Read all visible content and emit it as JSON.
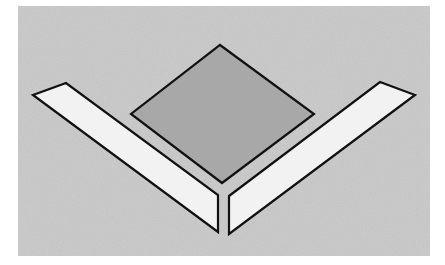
{
  "figure": {
    "background_color": "#ffffff",
    "panel": {
      "x": 18,
      "y": 6,
      "width": 412,
      "height": 250,
      "fill": "#c9c9c9"
    },
    "stroke_color": "#111111",
    "stroke_width": 2.2,
    "shapes": [
      {
        "name": "center-diamond",
        "fill": "#a8a8a8",
        "points": "220,45 314,114 222,183 131,114"
      },
      {
        "name": "left-bar",
        "fill": "#f2f2f2",
        "points": "33,95 66,83 218,195 218,232"
      },
      {
        "name": "right-bar",
        "fill": "#f2f2f2",
        "points": "229,196 380,82 415,95 229,234"
      }
    ]
  }
}
